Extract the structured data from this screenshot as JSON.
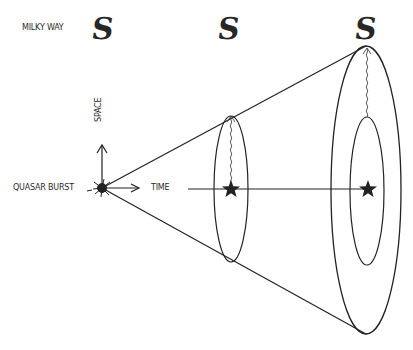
{
  "diagram": {
    "labels": {
      "milky_way": "MILKY WAY",
      "space": "SPACE",
      "quasar_burst": "QUASAR BURST",
      "time": "TIME"
    },
    "icons": {
      "galaxy_glyph": "S",
      "galaxy_icon": "milky-way-galaxy-icon",
      "star_icon": "star-icon",
      "burst_icon": "quasar-burst-icon"
    },
    "colors": {
      "ink": "#222222",
      "background": "#ffffff"
    },
    "elements": {
      "galaxies": [
        {
          "x": 104,
          "y": 28
        },
        {
          "x": 230,
          "y": 28
        },
        {
          "x": 366,
          "y": 28
        }
      ],
      "cone_apex": {
        "x": 102,
        "y": 188
      },
      "cross_sections": [
        {
          "cx": 231,
          "cy": 189,
          "rx": 17,
          "ry": 73,
          "has_star": true
        },
        {
          "cx": 366,
          "cy": 190,
          "rx": 35,
          "ry": 144,
          "inner_rx": 17,
          "inner_ry": 74,
          "has_star": true
        }
      ]
    }
  }
}
